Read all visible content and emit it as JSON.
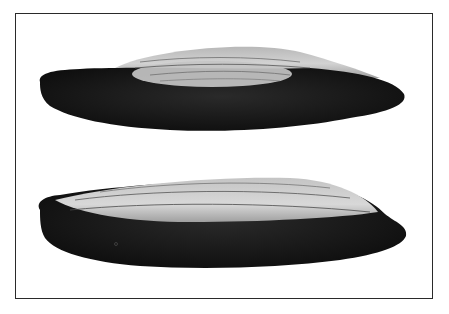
{
  "figure": {
    "specimens": [
      {
        "name": "upper-specimen",
        "view": "side",
        "tone": "dark base with light ridged top"
      },
      {
        "name": "lower-specimen",
        "view": "side",
        "tone": "dark base with light ridged top"
      }
    ],
    "colors": {
      "background": "#ffffff",
      "frame": "#2a2a2a",
      "specimen_dark": "#141414",
      "specimen_light": "#c9c9c9"
    }
  }
}
